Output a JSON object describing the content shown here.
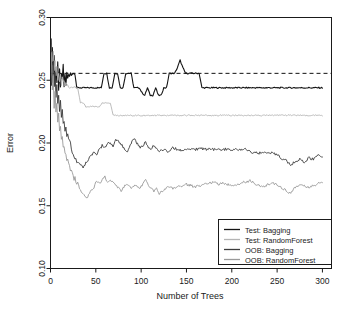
{
  "chart_data": {
    "type": "line",
    "title": "",
    "xlabel": "Number of Trees",
    "ylabel": "Error",
    "xlim": [
      0,
      310
    ],
    "ylim": [
      0.1,
      0.3
    ],
    "xticks": [
      0,
      50,
      100,
      150,
      200,
      250,
      300
    ],
    "xticklabels": [
      "0",
      "50",
      "100",
      "150",
      "200",
      "250",
      "300"
    ],
    "yticks": [
      0.1,
      0.15,
      0.2,
      0.25,
      0.3
    ],
    "yticklabels": [
      "0.10",
      "0.15",
      "0.20",
      "0.25",
      "0.30"
    ],
    "grid": false,
    "legend_position": "bottom-right",
    "reference_line": {
      "y": 0.2555,
      "style": "dashed",
      "color": "#111111"
    },
    "colors": {
      "test_bagging": "#141414",
      "test_randomforest": "#b4b4b4",
      "oob_bagging": "#3c3c3c",
      "oob_randomforest": "#9a9a9a"
    },
    "series": [
      {
        "name": "Test: Bagging",
        "color": "#141414",
        "x": [
          1,
          2,
          3,
          4,
          5,
          6,
          7,
          8,
          9,
          10,
          11,
          12,
          13,
          14,
          15,
          16,
          17,
          18,
          19,
          20,
          21,
          22,
          23,
          24,
          25,
          26,
          27,
          28,
          29,
          30,
          32,
          34,
          36,
          38,
          40,
          42,
          44,
          46,
          48,
          50,
          53,
          56,
          59,
          62,
          65,
          68,
          71,
          74,
          77,
          80,
          83,
          86,
          89,
          92,
          95,
          98,
          101,
          104,
          107,
          110,
          113,
          116,
          119,
          122,
          125,
          128,
          131,
          134,
          137,
          140,
          143,
          146,
          149,
          152,
          155,
          158,
          161,
          164,
          167,
          170,
          180,
          190,
          200,
          210,
          220,
          230,
          240,
          250,
          260,
          270,
          280,
          290,
          300
        ],
        "y": [
          0.246,
          0.277,
          0.262,
          0.27,
          0.246,
          0.26,
          0.249,
          0.265,
          0.242,
          0.258,
          0.244,
          0.256,
          0.25,
          0.262,
          0.245,
          0.254,
          0.246,
          0.256,
          0.252,
          0.254,
          0.253,
          0.2555,
          0.254,
          0.2555,
          0.2555,
          0.2555,
          0.2555,
          0.25,
          0.244,
          0.244,
          0.244,
          0.244,
          0.244,
          0.244,
          0.244,
          0.244,
          0.244,
          0.244,
          0.244,
          0.244,
          0.244,
          0.244,
          0.2555,
          0.2555,
          0.244,
          0.244,
          0.2555,
          0.2555,
          0.244,
          0.244,
          0.2555,
          0.2555,
          0.2555,
          0.244,
          0.244,
          0.244,
          0.24,
          0.238,
          0.244,
          0.238,
          0.238,
          0.244,
          0.238,
          0.238,
          0.244,
          0.244,
          0.2555,
          0.2555,
          0.2555,
          0.26,
          0.266,
          0.26,
          0.2555,
          0.2555,
          0.2555,
          0.2555,
          0.2555,
          0.2555,
          0.244,
          0.244,
          0.244,
          0.244,
          0.244,
          0.244,
          0.244,
          0.244,
          0.244,
          0.244,
          0.244,
          0.244,
          0.244,
          0.244,
          0.244
        ]
      },
      {
        "name": "Test: RandomForest",
        "color": "#b4b4b4",
        "x": [
          1,
          2,
          3,
          4,
          5,
          6,
          7,
          8,
          9,
          10,
          11,
          12,
          13,
          14,
          15,
          16,
          17,
          18,
          19,
          20,
          22,
          24,
          26,
          28,
          30,
          33,
          36,
          39,
          42,
          45,
          48,
          51,
          54,
          57,
          60,
          63,
          66,
          69,
          72,
          75,
          80,
          90,
          100,
          120,
          140,
          160,
          180,
          200,
          220,
          240,
          260,
          280,
          300
        ],
        "y": [
          0.27,
          0.264,
          0.272,
          0.258,
          0.266,
          0.254,
          0.262,
          0.25,
          0.256,
          0.248,
          0.254,
          0.246,
          0.252,
          0.248,
          0.25,
          0.246,
          0.248,
          0.246,
          0.246,
          0.245,
          0.244,
          0.244,
          0.244,
          0.244,
          0.244,
          0.232,
          0.232,
          0.229,
          0.229,
          0.229,
          0.229,
          0.229,
          0.229,
          0.232,
          0.232,
          0.232,
          0.232,
          0.222,
          0.222,
          0.222,
          0.222,
          0.222,
          0.222,
          0.222,
          0.222,
          0.222,
          0.222,
          0.222,
          0.222,
          0.222,
          0.222,
          0.222,
          0.222
        ]
      },
      {
        "name": "OOB: Bagging",
        "color": "#3c3c3c",
        "x": [
          1,
          2,
          3,
          4,
          5,
          6,
          7,
          8,
          9,
          10,
          11,
          12,
          13,
          14,
          15,
          16,
          17,
          18,
          19,
          20,
          22,
          24,
          26,
          28,
          30,
          33,
          36,
          39,
          42,
          45,
          48,
          51,
          54,
          57,
          60,
          63,
          66,
          69,
          72,
          75,
          78,
          81,
          84,
          87,
          90,
          93,
          96,
          99,
          102,
          105,
          108,
          111,
          114,
          117,
          120,
          125,
          130,
          135,
          140,
          145,
          150,
          155,
          160,
          165,
          170,
          175,
          180,
          185,
          190,
          195,
          200,
          205,
          210,
          215,
          220,
          225,
          230,
          235,
          240,
          245,
          250,
          255,
          260,
          265,
          270,
          275,
          280,
          285,
          290,
          295,
          300
        ],
        "y": [
          0.283,
          0.25,
          0.265,
          0.243,
          0.256,
          0.235,
          0.248,
          0.23,
          0.24,
          0.225,
          0.233,
          0.218,
          0.226,
          0.214,
          0.219,
          0.209,
          0.214,
          0.205,
          0.209,
          0.202,
          0.199,
          0.194,
          0.19,
          0.188,
          0.185,
          0.183,
          0.181,
          0.184,
          0.187,
          0.19,
          0.193,
          0.19,
          0.195,
          0.198,
          0.196,
          0.2,
          0.201,
          0.197,
          0.203,
          0.202,
          0.199,
          0.196,
          0.193,
          0.196,
          0.201,
          0.203,
          0.199,
          0.196,
          0.198,
          0.201,
          0.197,
          0.195,
          0.198,
          0.195,
          0.193,
          0.195,
          0.193,
          0.196,
          0.195,
          0.194,
          0.195,
          0.1955,
          0.195,
          0.1955,
          0.195,
          0.195,
          0.195,
          0.1945,
          0.195,
          0.195,
          0.195,
          0.195,
          0.195,
          0.195,
          0.193,
          0.1925,
          0.192,
          0.1915,
          0.1925,
          0.192,
          0.191,
          0.187,
          0.186,
          0.183,
          0.185,
          0.187,
          0.184,
          0.188,
          0.187,
          0.19,
          0.188
        ]
      },
      {
        "name": "OOB: RandomForest",
        "color": "#9a9a9a",
        "x": [
          1,
          2,
          3,
          4,
          5,
          6,
          7,
          8,
          9,
          10,
          11,
          12,
          13,
          14,
          15,
          16,
          17,
          18,
          19,
          20,
          22,
          24,
          26,
          28,
          30,
          33,
          36,
          39,
          42,
          45,
          48,
          51,
          54,
          57,
          60,
          63,
          66,
          69,
          72,
          75,
          78,
          81,
          84,
          87,
          90,
          93,
          96,
          99,
          102,
          105,
          108,
          111,
          114,
          117,
          120,
          125,
          130,
          135,
          140,
          145,
          150,
          155,
          160,
          165,
          170,
          175,
          180,
          185,
          190,
          195,
          200,
          205,
          210,
          215,
          220,
          225,
          230,
          235,
          240,
          245,
          250,
          255,
          260,
          265,
          270,
          275,
          280,
          285,
          290,
          295,
          300
        ],
        "y": [
          0.272,
          0.242,
          0.252,
          0.23,
          0.24,
          0.223,
          0.231,
          0.216,
          0.222,
          0.209,
          0.215,
          0.201,
          0.206,
          0.196,
          0.199,
          0.19,
          0.193,
          0.186,
          0.188,
          0.183,
          0.179,
          0.175,
          0.172,
          0.17,
          0.168,
          0.162,
          0.159,
          0.156,
          0.158,
          0.162,
          0.165,
          0.17,
          0.168,
          0.17,
          0.173,
          0.169,
          0.17,
          0.168,
          0.166,
          0.164,
          0.162,
          0.165,
          0.167,
          0.165,
          0.164,
          0.166,
          0.165,
          0.164,
          0.168,
          0.17,
          0.166,
          0.164,
          0.162,
          0.164,
          0.16,
          0.163,
          0.165,
          0.164,
          0.165,
          0.166,
          0.167,
          0.166,
          0.165,
          0.166,
          0.167,
          0.168,
          0.169,
          0.167,
          0.168,
          0.167,
          0.166,
          0.167,
          0.168,
          0.169,
          0.17,
          0.168,
          0.166,
          0.165,
          0.167,
          0.169,
          0.166,
          0.164,
          0.162,
          0.16,
          0.165,
          0.167,
          0.166,
          0.164,
          0.166,
          0.168,
          0.169
        ]
      }
    ]
  },
  "legend": {
    "items": [
      {
        "label": "Test: Bagging"
      },
      {
        "label": "Test: RandomForest"
      },
      {
        "label": "OOB: Bagging"
      },
      {
        "label": "OOB: RandomForest"
      }
    ]
  }
}
